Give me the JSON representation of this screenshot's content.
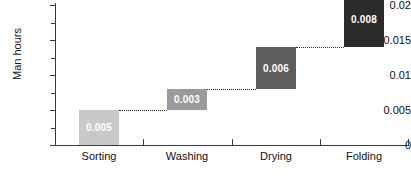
{
  "chart_data": {
    "type": "bar",
    "subtype": "waterfall",
    "title": "",
    "xlabel": "",
    "ylabel": "Man hours",
    "ylim": [
      0,
      0.02
    ],
    "ytick_labels": [
      "0",
      "0.005",
      "0.01",
      "0.015",
      "0.02"
    ],
    "ytick_values": [
      0,
      0.005,
      0.01,
      0.015,
      0.02
    ],
    "yminor_values": [
      0.0025,
      0.0075,
      0.0125,
      0.0175
    ],
    "grid": false,
    "legend": "none",
    "connectors": "dotted",
    "categories": [
      "Sorting",
      "Washing",
      "Drying",
      "Folding"
    ],
    "values": [
      0.005,
      0.003,
      0.006,
      0.008
    ],
    "data_labels": [
      "0.005",
      "0.003",
      "0.006",
      "0.008"
    ],
    "cumulative_start": [
      0,
      0.005,
      0.008,
      0.014
    ],
    "cumulative_end": [
      0.005,
      0.008,
      0.014,
      0.022
    ],
    "bar_colors": [
      "#c9c9c9",
      "#9a9a9a",
      "#5e5e5e",
      "#2b2b2b"
    ],
    "axis_color": "#3b3b3b",
    "label_color": "#111111",
    "value_label_color": "#ffffff",
    "background": "#ffffff"
  }
}
